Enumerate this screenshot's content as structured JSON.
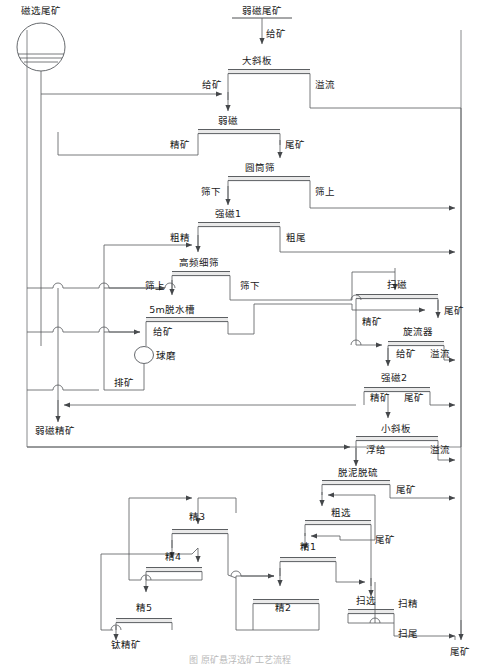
{
  "diagram": {
    "title_caption": "图     原矿悬浮选矿工艺流程",
    "feed_source": {
      "label": "磁选尾矿",
      "icon": "thickener-icon"
    },
    "top_feed": {
      "label": "弱磁尾矿",
      "stream": "给矿"
    },
    "final_products": [
      {
        "id": "weak-mag-conc",
        "label": "弱磁精矿"
      },
      {
        "id": "ti-conc",
        "label": "钛精矿"
      },
      {
        "id": "tailings",
        "label": "尾矿"
      }
    ],
    "units": [
      {
        "id": "big-incline-plate",
        "label": "大斜板",
        "in": [
          "给矿"
        ],
        "out": [
          "溢流"
        ]
      },
      {
        "id": "weak-mag",
        "label": "弱磁",
        "in": [
          "精矿"
        ],
        "out": [
          "尾矿"
        ]
      },
      {
        "id": "drum-screen",
        "label": "圆筒筛",
        "in": [
          "筛下"
        ],
        "out": [
          "筛上"
        ]
      },
      {
        "id": "strong-mag-1",
        "label": "强磁1",
        "in": [
          "粗精"
        ],
        "out": [
          "粗尾"
        ]
      },
      {
        "id": "hf-fine-screen",
        "label": "高频细筛",
        "in": [
          "筛上"
        ],
        "out": [
          "筛下"
        ]
      },
      {
        "id": "dewater-tank-5m",
        "label": "5m脱水槽",
        "in": [
          "给矿"
        ],
        "out": []
      },
      {
        "id": "ball-mill",
        "label": "球磨",
        "in": [],
        "out": [
          "排矿"
        ],
        "icon": "circle-mill-icon"
      },
      {
        "id": "scavenge-mag",
        "label": "扫磁",
        "in": [
          "精矿"
        ],
        "out": [
          "尾矿"
        ]
      },
      {
        "id": "cyclone",
        "label": "旋流器",
        "in": [
          "给矿"
        ],
        "out": [
          "溢流"
        ]
      },
      {
        "id": "strong-mag-2",
        "label": "强磁2",
        "in": [
          "精矿"
        ],
        "out": [
          "尾矿"
        ]
      },
      {
        "id": "small-incline",
        "label": "小斜板",
        "in": [
          "浮给"
        ],
        "out": [
          "溢流"
        ]
      },
      {
        "id": "desliming-desulf",
        "label": "脱泥脱硫",
        "in": [],
        "out": [
          "尾矿"
        ]
      },
      {
        "id": "rougher",
        "label": "粗选",
        "in": [],
        "out": [
          "尾矿"
        ]
      },
      {
        "id": "cleaner-1",
        "label": "精1",
        "in": [],
        "out": []
      },
      {
        "id": "cleaner-2",
        "label": "精2",
        "in": [],
        "out": []
      },
      {
        "id": "cleaner-3",
        "label": "精3",
        "in": [],
        "out": []
      },
      {
        "id": "cleaner-4",
        "label": "精4",
        "in": [],
        "out": []
      },
      {
        "id": "cleaner-5",
        "label": "精5",
        "in": [],
        "out": []
      },
      {
        "id": "scavenger",
        "label": "扫选",
        "in": [],
        "out": [
          "扫精",
          "扫尾"
        ]
      }
    ],
    "stream_labels": {
      "feed": "给矿",
      "overflow": "溢流",
      "concentrate": "精矿",
      "tailings": "尾矿",
      "under_screen": "筛下",
      "over_screen": "筛上",
      "rough_conc": "粗精",
      "rough_tail": "粗尾",
      "mill_discharge": "排矿",
      "float_feed": "浮给",
      "scav_conc": "扫精",
      "scav_tail": "扫尾"
    },
    "text_nodes": [
      {
        "id": "t-cixuanweikuang",
        "text": "磁选尾矿",
        "x": 41,
        "y": 11,
        "anchor": "middle"
      },
      {
        "id": "t-ruocitail",
        "text": "弱磁尾矿",
        "x": 262,
        "y": 13,
        "anchor": "middle"
      },
      {
        "id": "t-gk1",
        "text": "给矿",
        "x": 264,
        "y": 40,
        "anchor": "start"
      },
      {
        "id": "t-daxieban",
        "text": "大斜板",
        "x": 255,
        "y": 65,
        "anchor": "middle"
      },
      {
        "id": "t-gk2",
        "text": "给矿",
        "x": 213,
        "y": 86,
        "anchor": "middle"
      },
      {
        "id": "t-yiliu1",
        "text": "溢流",
        "x": 302,
        "y": 86,
        "anchor": "start"
      },
      {
        "id": "t-ruoci",
        "text": "弱磁",
        "x": 224,
        "y": 125,
        "anchor": "middle"
      },
      {
        "id": "t-jingkuang1",
        "text": "精矿",
        "x": 192,
        "y": 146,
        "anchor": "middle"
      },
      {
        "id": "t-weikuang1",
        "text": "尾矿",
        "x": 272,
        "y": 146,
        "anchor": "start"
      },
      {
        "id": "t-yuantongshai",
        "text": "圆筒筛",
        "x": 258,
        "y": 172,
        "anchor": "middle"
      },
      {
        "id": "t-shaixia1",
        "text": "筛下",
        "x": 213,
        "y": 192,
        "anchor": "middle"
      },
      {
        "id": "t-shaishang1",
        "text": "筛上",
        "x": 300,
        "y": 192,
        "anchor": "start"
      },
      {
        "id": "t-qiangci1",
        "text": "强磁1",
        "x": 226,
        "y": 218,
        "anchor": "middle"
      },
      {
        "id": "t-cujing",
        "text": "粗精",
        "x": 184,
        "y": 238,
        "anchor": "middle"
      },
      {
        "id": "t-cuwei",
        "text": "粗尾",
        "x": 267,
        "y": 238,
        "anchor": "start"
      },
      {
        "id": "t-gaopinxishai",
        "text": "高频细筛",
        "x": 199,
        "y": 265,
        "anchor": "middle"
      },
      {
        "id": "t-shaishang2",
        "text": "筛上",
        "x": 160,
        "y": 285,
        "anchor": "middle"
      },
      {
        "id": "t-shaixia2",
        "text": "筛下",
        "x": 242,
        "y": 285,
        "anchor": "start"
      },
      {
        "id": "t-saoci",
        "text": "扫磁",
        "x": 397,
        "y": 285,
        "anchor": "middle"
      },
      {
        "id": "t-5mtuoshuicao",
        "text": "5m脱水槽",
        "x": 172,
        "y": 311,
        "anchor": "middle"
      },
      {
        "id": "t-weikuang2",
        "text": "尾矿",
        "x": 438,
        "y": 311,
        "anchor": "start"
      },
      {
        "id": "t-jingkuang2",
        "text": "精矿",
        "x": 372,
        "y": 320,
        "anchor": "middle"
      },
      {
        "id": "t-gk3",
        "text": "给矿",
        "x": 162,
        "y": 332,
        "anchor": "middle"
      },
      {
        "id": "t-xuanliuqi",
        "text": "旋流器",
        "x": 419,
        "y": 332,
        "anchor": "middle"
      },
      {
        "id": "t-gk4",
        "text": "给矿",
        "x": 405,
        "y": 354,
        "anchor": "middle"
      },
      {
        "id": "t-yiliu2",
        "text": "溢流",
        "x": 437,
        "y": 354,
        "anchor": "middle"
      },
      {
        "id": "t-qiumo",
        "text": "球磨",
        "x": 155,
        "y": 360,
        "anchor": "start"
      },
      {
        "id": "t-qiangci2",
        "text": "强磁2",
        "x": 394,
        "y": 378,
        "anchor": "middle"
      },
      {
        "id": "t-paikuang",
        "text": "排矿",
        "x": 124,
        "y": 383,
        "anchor": "middle"
      },
      {
        "id": "t-jingkuang3",
        "text": "精矿",
        "x": 378,
        "y": 398,
        "anchor": "middle"
      },
      {
        "id": "t-weikuang3",
        "text": "尾矿",
        "x": 411,
        "y": 398,
        "anchor": "middle"
      },
      {
        "id": "t-ruocijingkuang",
        "text": "弱磁精矿",
        "x": 52,
        "y": 430,
        "anchor": "middle"
      },
      {
        "id": "t-xiaoxieban",
        "text": "小斜板",
        "x": 394,
        "y": 430,
        "anchor": "middle"
      },
      {
        "id": "t-fugei",
        "text": "浮给",
        "x": 374,
        "y": 450,
        "anchor": "middle"
      },
      {
        "id": "t-yiliu3",
        "text": "溢流",
        "x": 437,
        "y": 450,
        "anchor": "middle"
      },
      {
        "id": "t-tuonituoliu",
        "text": "脱泥脱硫",
        "x": 360,
        "y": 474,
        "anchor": "middle"
      },
      {
        "id": "t-weikuang4",
        "text": "尾矿",
        "x": 389,
        "y": 495,
        "anchor": "start"
      },
      {
        "id": "t-cuxuan",
        "text": "粗选",
        "x": 341,
        "y": 514,
        "anchor": "middle"
      },
      {
        "id": "t-jing3",
        "text": "精3",
        "x": 195,
        "y": 517,
        "anchor": "middle"
      },
      {
        "id": "t-weikuang5",
        "text": "尾矿",
        "x": 367,
        "y": 540,
        "anchor": "start"
      },
      {
        "id": "t-jing4",
        "text": "精4",
        "x": 173,
        "y": 567,
        "anchor": "middle"
      },
      {
        "id": "t-jing1",
        "text": "精1",
        "x": 310,
        "y": 565,
        "anchor": "middle"
      },
      {
        "id": "t-jing5",
        "text": "精5",
        "x": 144,
        "y": 607,
        "anchor": "middle"
      },
      {
        "id": "t-jing2",
        "text": "精2",
        "x": 283,
        "y": 607,
        "anchor": "middle"
      },
      {
        "id": "t-saoxuan",
        "text": "扫选",
        "x": 363,
        "y": 607,
        "anchor": "middle"
      },
      {
        "id": "t-saojing",
        "text": "扫精",
        "x": 395,
        "y": 604,
        "anchor": "start"
      },
      {
        "id": "t-saowei",
        "text": "扫尾",
        "x": 395,
        "y": 634,
        "anchor": "start"
      },
      {
        "id": "t-tijingkuang",
        "text": "钛精矿",
        "x": 125,
        "y": 645,
        "anchor": "middle"
      },
      {
        "id": "t-weikuang6",
        "text": "尾矿",
        "x": 456,
        "y": 645,
        "anchor": "middle"
      }
    ]
  }
}
